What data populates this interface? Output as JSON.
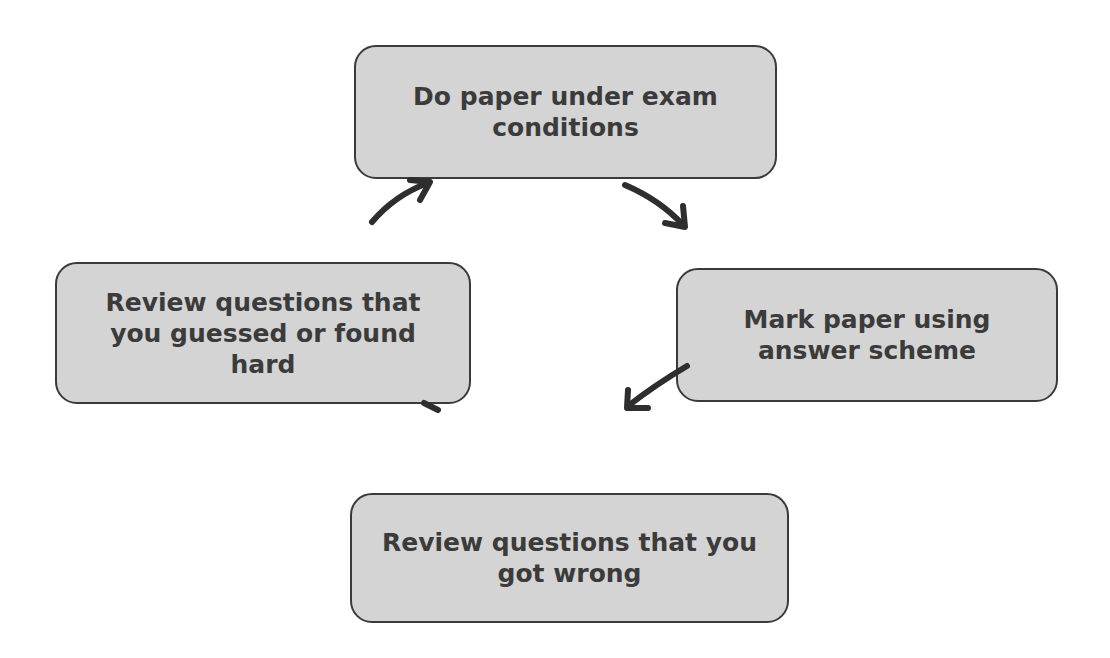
{
  "diagram": {
    "type": "cycle",
    "nodes": [
      {
        "id": "top",
        "label": "Do paper under exam conditions"
      },
      {
        "id": "right",
        "label": "Mark paper using answer scheme"
      },
      {
        "id": "bottom",
        "label": "Review questions that you got wrong"
      },
      {
        "id": "left",
        "label": "Review questions that you guessed or found hard"
      }
    ],
    "edges": [
      {
        "from": "top",
        "to": "right"
      },
      {
        "from": "right",
        "to": "bottom"
      },
      {
        "from": "bottom",
        "to": "left"
      },
      {
        "from": "left",
        "to": "top"
      }
    ],
    "colors": {
      "box_fill": "#d4d4d4",
      "box_border": "#3a3a3a",
      "text": "#3b3b3b",
      "arrow": "#2e2e2e",
      "background": "#ffffff"
    }
  }
}
